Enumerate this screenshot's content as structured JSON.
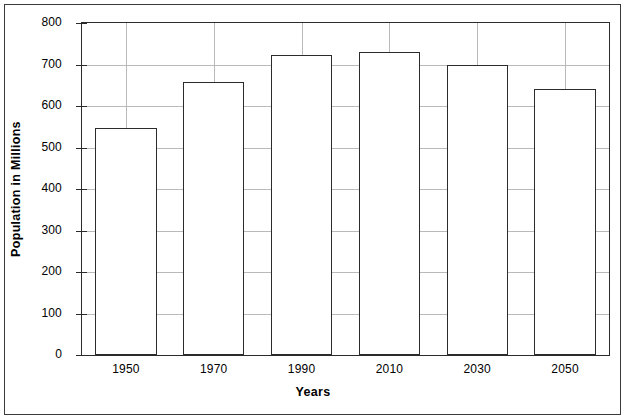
{
  "chart_data": {
    "type": "bar",
    "title": "",
    "xlabel": "Years",
    "ylabel": "Population in Millions",
    "categories": [
      "1950",
      "1970",
      "1990",
      "2010",
      "2030",
      "2050"
    ],
    "values": [
      548,
      658,
      723,
      730,
      698,
      642
    ],
    "ylim": [
      0,
      800
    ],
    "ytick_labels": [
      "0",
      "100",
      "200",
      "300",
      "400",
      "500",
      "600",
      "700",
      "800"
    ],
    "ytick_values": [
      0,
      100,
      200,
      300,
      400,
      500,
      600,
      700,
      800
    ],
    "grid": "both",
    "legend": "none",
    "colors": {
      "bar_fill": "#ffffff",
      "bar_stroke": "#2b2b2b",
      "grid": "#b9b9b9",
      "axis": "#2b2b2b",
      "outer_frame": "#3a3a3a",
      "text": "#000000",
      "background": "#ffffff"
    }
  }
}
